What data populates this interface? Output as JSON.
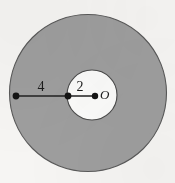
{
  "figure": {
    "background_color": "#f6f5f3",
    "annulus_fill_color": "#9e9e9e",
    "inner_fill_color": "#fbfbfa",
    "stroke_color": "#4a4a4a",
    "label_color": "#1b1b1b"
  },
  "shapes": {
    "outer_circle": {
      "name": "outer-circle",
      "cx": 88,
      "cy": 93,
      "r": 78.5
    },
    "inner_circle": {
      "name": "inner-circle",
      "cx": 92,
      "cy": 95,
      "r": 25
    },
    "radius_line": {
      "name": "radius-line",
      "x1": 16,
      "y1": 96,
      "x2": 95,
      "y2": 96
    }
  },
  "points": [
    {
      "id": "outer-edge-point",
      "cx": 16,
      "cy": 96,
      "r": 3.4
    },
    {
      "id": "inner-edge-point",
      "cx": 68,
      "cy": 96,
      "r": 3.4
    },
    {
      "id": "center-point",
      "cx": 95,
      "cy": 96,
      "r": 3.2
    }
  ],
  "labels": {
    "outer_segment": {
      "text": "4",
      "x": 41,
      "y": 91,
      "font_size": 14,
      "style": "normal"
    },
    "inner_segment": {
      "text": "2",
      "x": 80,
      "y": 91,
      "font_size": 14,
      "style": "normal"
    },
    "center": {
      "text": "O",
      "x": 100,
      "y": 99,
      "font_size": 13,
      "style": "italic"
    }
  },
  "chart_data": {
    "type": "diagram",
    "measurements": [
      {
        "label": "4",
        "meaning": "outer band segment length",
        "value": 4
      },
      {
        "label": "2",
        "meaning": "inner circle radius",
        "value": 2
      }
    ],
    "center_label": "O",
    "total_radius": 6
  }
}
